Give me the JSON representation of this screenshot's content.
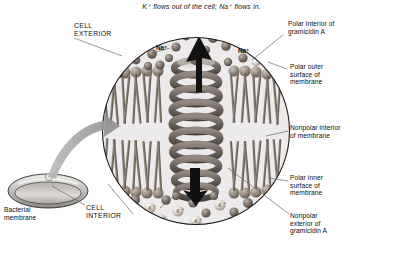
{
  "figure": {
    "caption": "K⁺ flows out of the cell; Na⁺ flows in."
  },
  "labels": {
    "cell_exterior": "CELL\nEXTERIOR",
    "cell_interior": "CELL\nINTERIOR",
    "bacterial_membrane": "Bacterial\nmembrane",
    "polar_interior_gramicidin": "Polar interior of\ngramicidin A",
    "polar_outer_surface": "Polar outer\nsurface of\nmembrane",
    "nonpolar_interior": "Nonpolar interior\nof membrane",
    "polar_inner_surface": "Polar inner\nsurface of\nmembrane",
    "nonpolar_exterior_gramicidin": "Nonpolar\nexterior of\ngramicidin A"
  },
  "ions": {
    "sodium_label_left": "Na⁺",
    "sodium_label_right": "Na⁺",
    "potassium_symbol": "K⁺",
    "exterior_ion_count": 26,
    "interior_ion_count": 16
  },
  "colors": {
    "outline": "#1a1a1a",
    "inset_background": "#eceaea",
    "membrane_lipid": "#8d8278",
    "helix": "#6f6660",
    "arrow_black": "#111111",
    "arrow_gray": "#9a9a9a",
    "ion_dark": "#6b6059",
    "ion_light": "#d6d2cc",
    "leader_line": "#666666",
    "bacterium_body": "#c9c6c1"
  },
  "structure": {
    "inset_center_x": 196,
    "inset_center_y": 131,
    "inset_radius": 94,
    "helix_coils": 10,
    "membrane_top_y": 72,
    "membrane_bottom_y": 192
  }
}
